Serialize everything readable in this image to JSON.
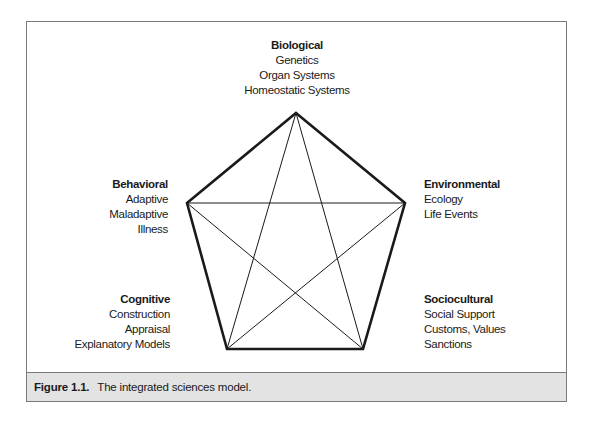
{
  "diagram": {
    "type": "pentagram-in-pentagon",
    "vertices": {
      "top": [
        296,
        113
      ],
      "right": [
        405,
        203
      ],
      "bottom_right": [
        363,
        349
      ],
      "bottom_left": [
        227,
        349
      ],
      "left": [
        187,
        203
      ]
    },
    "nodes": [
      {
        "id": "biological",
        "title": "Biological",
        "items": [
          "Genetics",
          "Organ Systems",
          "Homeostatic Systems"
        ]
      },
      {
        "id": "environmental",
        "title": "Environmental",
        "items": [
          "Ecology",
          "Life Events"
        ]
      },
      {
        "id": "sociocultural",
        "title": "Sociocultural",
        "items": [
          "Social Support",
          "Customs, Values",
          "Sanctions"
        ]
      },
      {
        "id": "cognitive",
        "title": "Cognitive",
        "items": [
          "Construction",
          "Appraisal",
          "Explanatory Models"
        ]
      },
      {
        "id": "behavioral",
        "title": "Behavioral",
        "items": [
          "Adaptive",
          "Maladaptive",
          "Illness"
        ]
      }
    ],
    "colors": {
      "stroke": "#1a1a1a",
      "frame": "#7a7a7a",
      "caption_bg": "#e3e3e3"
    }
  },
  "caption": {
    "number": "Figure 1.1.",
    "text": "The integrated sciences model."
  }
}
